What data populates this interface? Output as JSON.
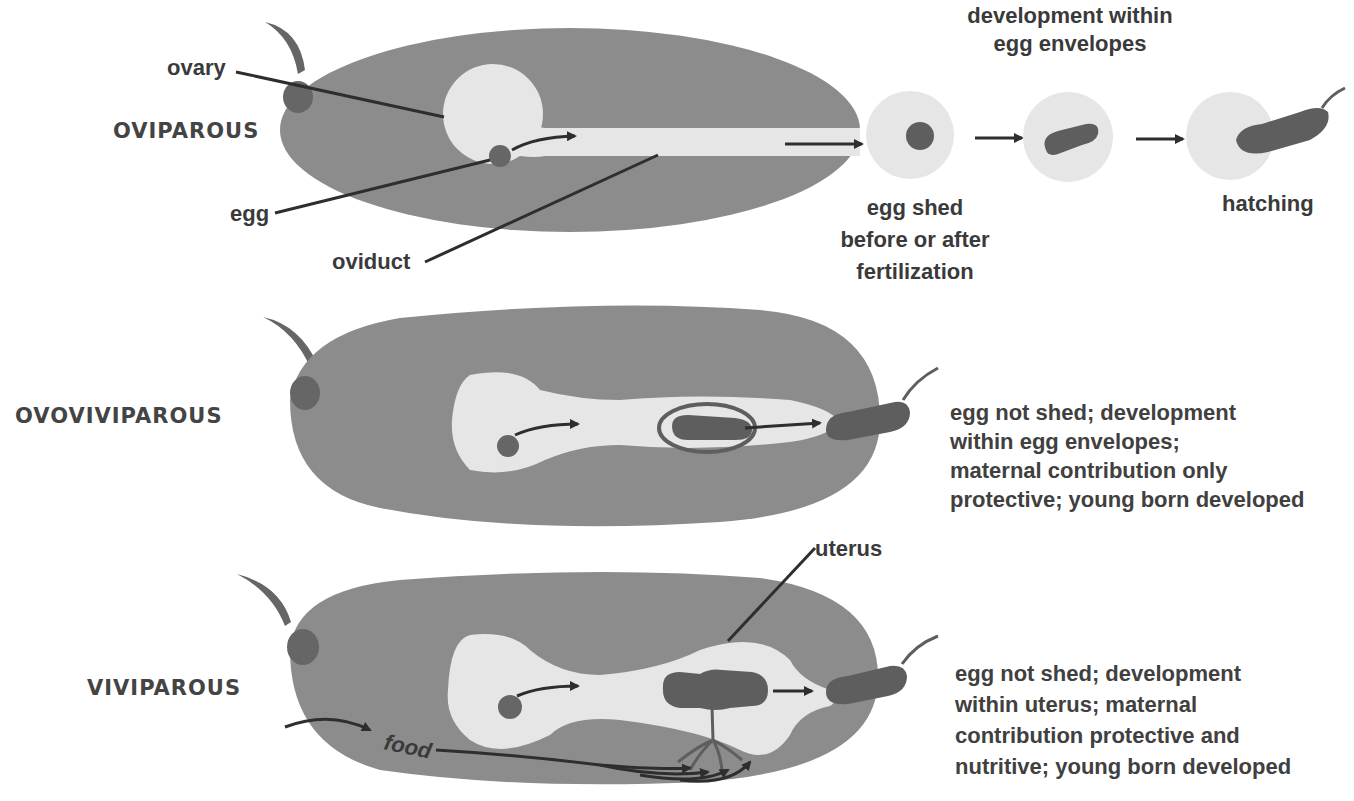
{
  "colors": {
    "body": "#8c8c8c",
    "organ_light": "#e6e6e6",
    "embryo": "#5e5e5e",
    "ovary": "#666666",
    "leader_line": "#2e2e2e",
    "text": "#3a3a3a"
  },
  "rows": [
    {
      "heading": "OVIPAROUS",
      "labels": {
        "ovary": "ovary",
        "egg": "egg",
        "oviduct": "oviduct"
      },
      "stages": {
        "top_caption_line1": "development within",
        "top_caption_line2": "egg envelopes",
        "shed_line1": "egg shed",
        "shed_line2": "before or after",
        "shed_line3": "fertilization",
        "hatching": "hatching"
      }
    },
    {
      "heading": "OVOVIVIPAROUS",
      "description": [
        "egg not shed; development",
        "within egg envelopes;",
        "maternal contribution only",
        "protective; young born developed"
      ]
    },
    {
      "heading": "VIVIPAROUS",
      "labels": {
        "uterus": "uterus",
        "food": "food"
      },
      "description": [
        "egg not shed; development",
        "within uterus; maternal",
        "contribution protective and",
        "nutritive; young born developed"
      ]
    }
  ]
}
